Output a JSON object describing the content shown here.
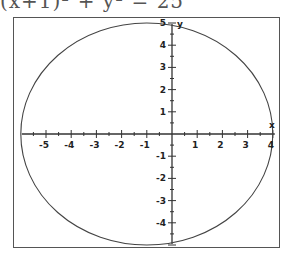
{
  "caption": {
    "text": "  (x+1)² + y² = 25"
  },
  "chart_data": {
    "type": "line",
    "title": "",
    "equation": "(x+1)^2 + y^2 = 25",
    "shape": "circle",
    "center": [
      -1,
      0
    ],
    "radius": 5,
    "xlabel": "x",
    "ylabel": "y",
    "xlim": [
      -6,
      4
    ],
    "ylim": [
      -5,
      5
    ],
    "x_ticks": [
      -5,
      -4,
      -3,
      -2,
      -1,
      1,
      2,
      3,
      4
    ],
    "y_ticks": [
      -4,
      -3,
      -2,
      -1,
      1,
      2,
      3,
      4,
      5
    ],
    "minor_ticks_per_unit": 2,
    "grid": false,
    "legend": null,
    "colors": {
      "curve": "#444444",
      "axes": "#333333",
      "frame": "#555555",
      "text": "#222222"
    }
  }
}
